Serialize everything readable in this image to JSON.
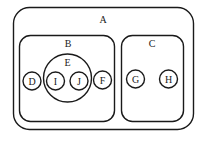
{
  "diagram": {
    "type": "nested-set-diagram",
    "stroke_color": "#1a1a1a",
    "background": "#ffffff",
    "sets": [
      {
        "id": "A",
        "label": "A",
        "shape": "rounded-rect",
        "parent": null,
        "children": [
          "B",
          "C"
        ]
      },
      {
        "id": "B",
        "label": "B",
        "shape": "rounded-rect",
        "parent": "A",
        "children": [
          "D",
          "E",
          "F"
        ]
      },
      {
        "id": "C",
        "label": "C",
        "shape": "rounded-rect",
        "parent": "A",
        "children": [
          "G",
          "H"
        ]
      },
      {
        "id": "D",
        "label": "D",
        "shape": "circle",
        "parent": "B",
        "children": []
      },
      {
        "id": "E",
        "label": "E",
        "shape": "circle",
        "parent": "B",
        "children": [
          "I",
          "J"
        ]
      },
      {
        "id": "F",
        "label": "F",
        "shape": "circle",
        "parent": "B",
        "children": []
      },
      {
        "id": "G",
        "label": "G",
        "shape": "circle",
        "parent": "C",
        "children": []
      },
      {
        "id": "H",
        "label": "H",
        "shape": "circle",
        "parent": "C",
        "children": []
      },
      {
        "id": "I",
        "label": "I",
        "shape": "circle",
        "parent": "E",
        "children": []
      },
      {
        "id": "J",
        "label": "J",
        "shape": "circle",
        "parent": "E",
        "children": []
      }
    ],
    "labels": {
      "A": "A",
      "B": "B",
      "C": "C",
      "D": "D",
      "E": "E",
      "F": "F",
      "G": "G",
      "H": "H",
      "I": "I",
      "J": "J"
    }
  }
}
